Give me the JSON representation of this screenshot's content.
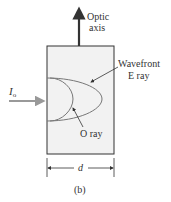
{
  "diagram": {
    "optic_axis_label_line1": "Optic",
    "optic_axis_label_line2": "axis",
    "incident_label_main": "I",
    "incident_label_sub": "o",
    "wavefront_label_line1": "Wavefront",
    "wavefront_label_line2": "E ray",
    "o_ray_label": "O ray",
    "dimension_label": "d",
    "caption": "(b)"
  },
  "colors": {
    "crystal_fill": "#f2f2f2",
    "crystal_border": "#333333",
    "arrow_dark": "#333333",
    "incident_arrow": "#999999",
    "wavefront_curve": "#777777"
  }
}
